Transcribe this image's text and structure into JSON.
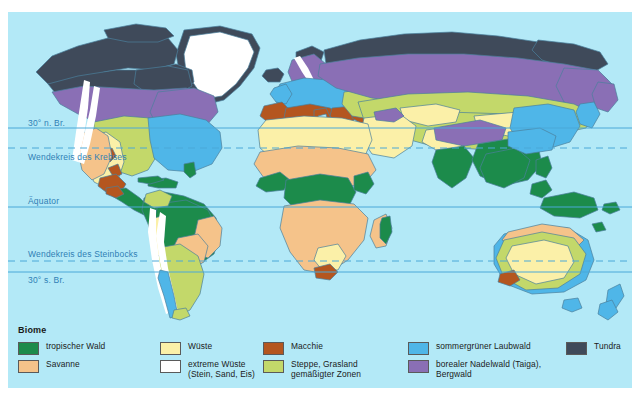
{
  "map": {
    "ocean_color": "#b3e9f7",
    "grid_color": "#4ba8d8",
    "latitude_labels": [
      {
        "id": "lat-30n",
        "text": "30° n. Br.",
        "y": 118,
        "line_y": 128,
        "dashed": false
      },
      {
        "id": "tropic-cancer",
        "text": "Wendekreis des\nKrebses",
        "y": 152,
        "line_y": 148,
        "dashed": true
      },
      {
        "id": "equator",
        "text": "Äquator",
        "y": 196,
        "line_y": 207,
        "dashed": false
      },
      {
        "id": "tropic-capricorn",
        "text": "Wendekreis des Steinbocks",
        "y": 249,
        "line_y": 261,
        "dashed": true
      },
      {
        "id": "lat-30s",
        "text": "30° s. Br.",
        "y": 272,
        "line_y": 272,
        "dashed": false
      }
    ]
  },
  "legend": {
    "title": "Biome",
    "items": [
      {
        "label": "tropischer Wald",
        "color": "#1c8b4b",
        "col": 0,
        "row": 0
      },
      {
        "label": "Savanne",
        "color": "#f5c38a",
        "col": 0,
        "row": 1
      },
      {
        "label": "Wüste",
        "color": "#fbf0a8",
        "col": 1,
        "row": 0
      },
      {
        "label": "extreme Wüste\n(Stein, Sand, Eis)",
        "color": "#ffffff",
        "col": 1,
        "row": 1
      },
      {
        "label": "Macchie",
        "color": "#b4561f",
        "col": 2,
        "row": 0
      },
      {
        "label": "Steppe, Grasland\ngemäßigter Zonen",
        "color": "#c3d86a",
        "col": 2,
        "row": 1
      },
      {
        "label": "sommergrüner Laubwald",
        "color": "#4fb6e8",
        "col": 3,
        "row": 0
      },
      {
        "label": "borealer Nadelwald (Taiga),\nBergwald",
        "color": "#8a6fb5",
        "col": 3,
        "row": 1
      },
      {
        "label": "Tundra",
        "color": "#3f4a5a",
        "col": 4,
        "row": 0
      }
    ]
  },
  "biome_colors": {
    "tropical_forest": "#1c8b4b",
    "savanna": "#f5c38a",
    "desert": "#fbf0a8",
    "extreme_desert": "#ffffff",
    "macchie": "#b4561f",
    "steppe": "#c3d86a",
    "deciduous_forest": "#4fb6e8",
    "taiga": "#8a6fb5",
    "tundra": "#3f4a5a",
    "coast_outline": "#4a7f9c"
  }
}
